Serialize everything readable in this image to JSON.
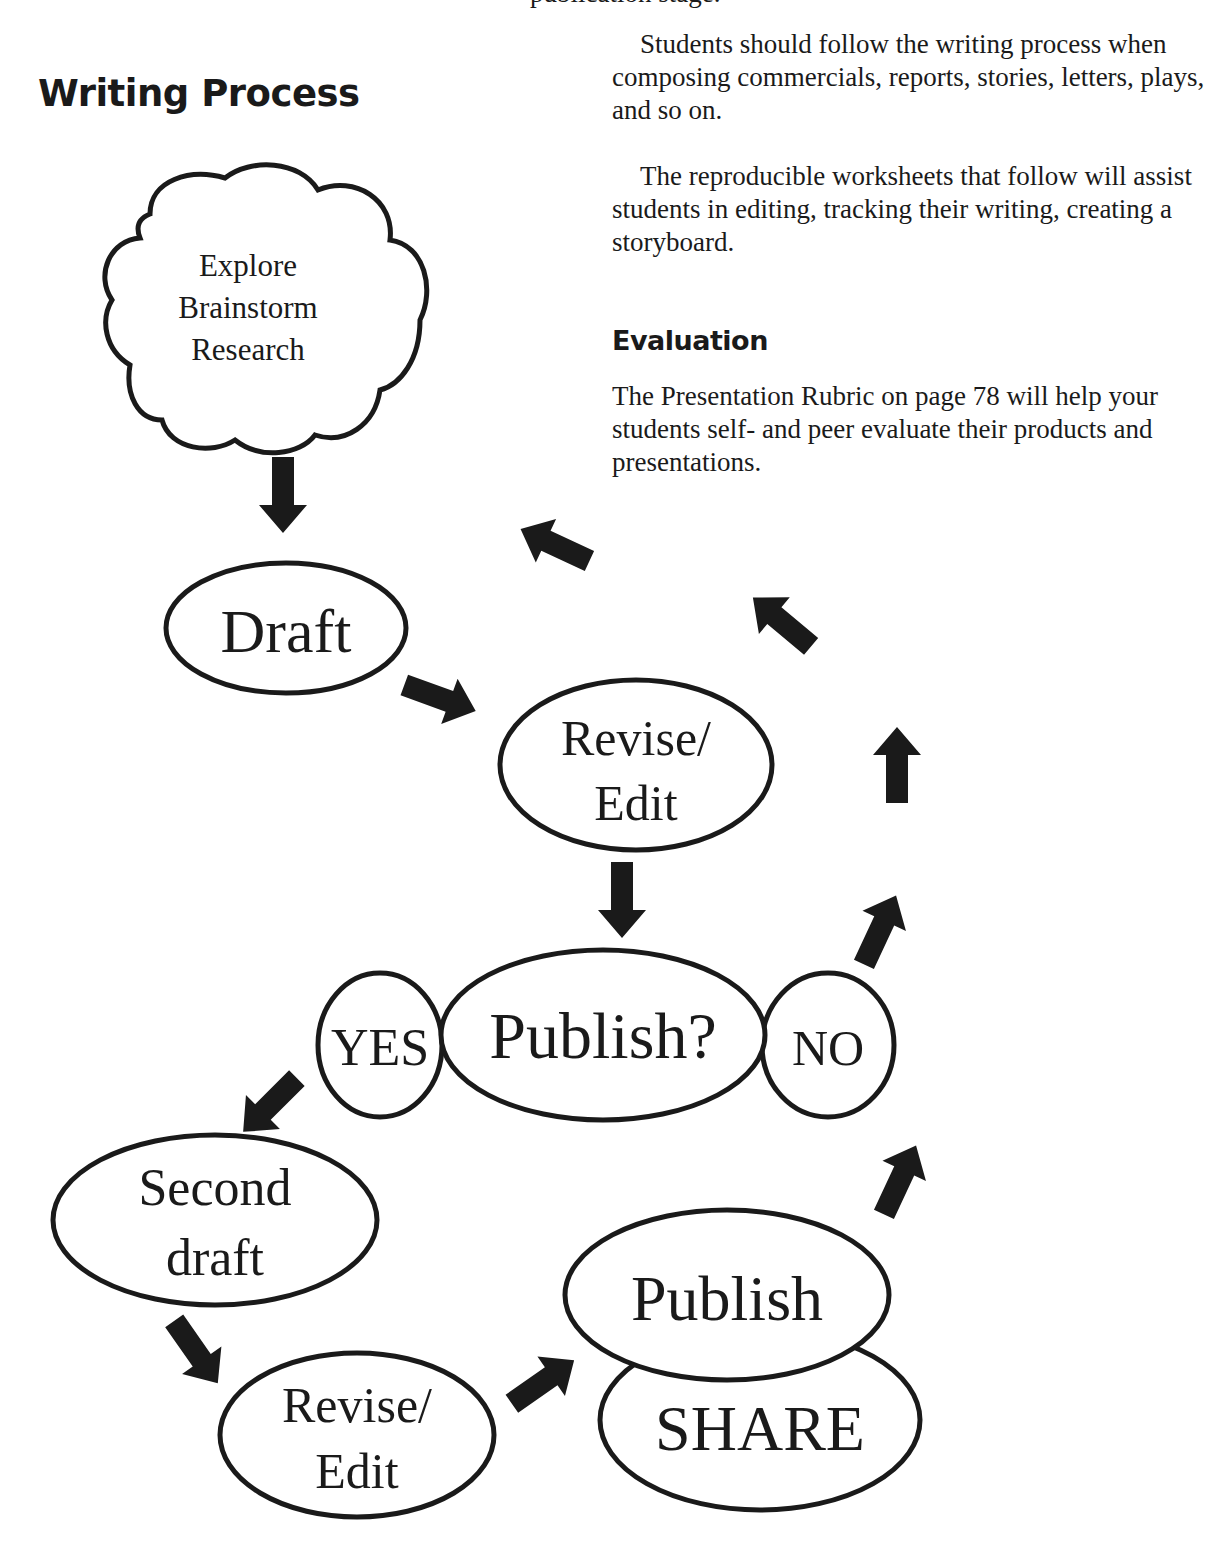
{
  "page": {
    "cut_top_line": "publication stage.",
    "title": "Writing Process",
    "intro_paragraph_1": "Students should follow the writing process when composing commercials, reports, stories, letters, plays, and so on.",
    "intro_paragraph_2": "The reproducible worksheets that follow will assist students in editing, tracking their writing, creating a storyboard.",
    "evaluation_heading": "Evaluation",
    "evaluation_paragraph": "The Presentation Rubric on page 78 will help your students self- and peer evaluate their products and presentations."
  },
  "diagram": {
    "cloud": [
      "Explore",
      "Brainstorm",
      "Research"
    ],
    "draft": "Draft",
    "revise_1": [
      "Revise/",
      "Edit"
    ],
    "publish_question": "Publish?",
    "yes": "YES",
    "no": "NO",
    "second_draft": [
      "Second",
      "draft"
    ],
    "revise_2": [
      "Revise/",
      "Edit"
    ],
    "publish": "Publish",
    "share": "SHARE",
    "colors": {
      "ink": "#1a1a1a",
      "paper": "#ffffff"
    }
  }
}
